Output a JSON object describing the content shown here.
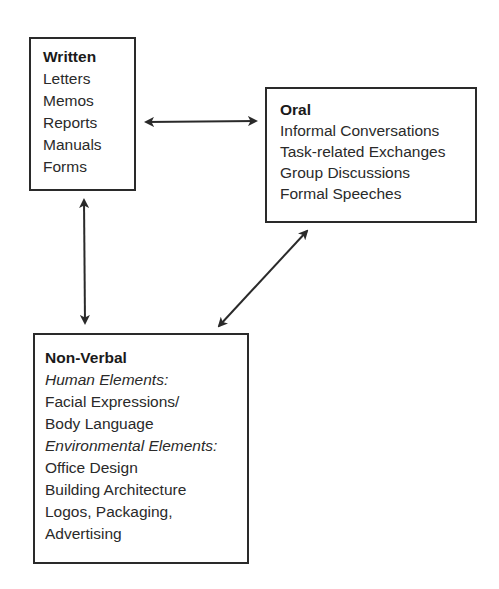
{
  "diagram": {
    "written": {
      "title": "Written",
      "items": [
        "Letters",
        "Memos",
        "Reports",
        "Manuals",
        "Forms"
      ]
    },
    "oral": {
      "title": "Oral",
      "items": [
        "Informal Conversations",
        "Task-related Exchanges",
        "Group Discussions",
        "Formal Speeches"
      ]
    },
    "nonverbal": {
      "title": "Non-Verbal",
      "human_heading": "Human Elements:",
      "human_items": [
        "Facial Expressions/",
        "Body Language"
      ],
      "environmental_heading": "Environmental Elements:",
      "environmental_items": [
        "Office Design",
        "Building Architecture",
        "Logos, Packaging,",
        "Advertising"
      ]
    },
    "connections": [
      {
        "from": "written",
        "to": "oral",
        "type": "bidirectional"
      },
      {
        "from": "written",
        "to": "nonverbal",
        "type": "bidirectional"
      },
      {
        "from": "oral",
        "to": "nonverbal",
        "type": "bidirectional"
      }
    ],
    "colors": {
      "stroke": "#2a2a2a",
      "text": "#2a2a2a",
      "background": "#ffffff"
    }
  }
}
